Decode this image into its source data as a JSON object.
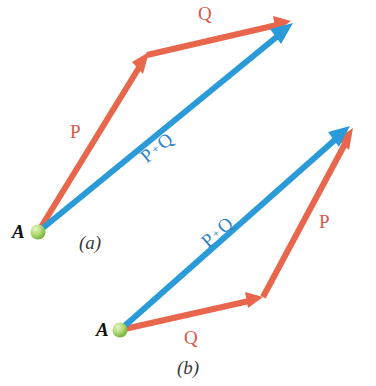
{
  "figure": {
    "background_color": "#ffffff",
    "colors": {
      "vector_p_q": "#e8674c",
      "vector_sum": "#2a9bd8",
      "label_red": "#d9594b",
      "label_blue": "#2f86c4",
      "point_marker": "#8cc63f",
      "text_dark": "#111111"
    }
  },
  "panels": [
    {
      "id": "a",
      "caption": "(a)",
      "origin_label": "A",
      "labels": {
        "p": "P",
        "q": "Q",
        "sum_first": "P",
        "sum_plus": "+",
        "sum_second": "Q"
      },
      "geometry": {
        "origin": [
          38,
          232
        ],
        "p_tip": [
          149,
          52
        ],
        "q_tip": [
          291,
          21
        ],
        "sum_tip": [
          293,
          23
        ]
      }
    },
    {
      "id": "b",
      "caption": "(b)",
      "origin_label": "A",
      "labels": {
        "p": "P",
        "q": "Q",
        "sum_first": "P",
        "sum_plus": "+",
        "sum_second": "Q"
      },
      "geometry": {
        "origin": [
          120,
          330
        ],
        "q_tip": [
          263,
          297
        ],
        "p_tip": [
          353,
          128
        ],
        "sum_tip": [
          350,
          126
        ]
      }
    }
  ],
  "text_positions": {
    "a_p": "P",
    "a_q": "Q",
    "a_A": "A",
    "a_caption": "(a)",
    "b_p": "P",
    "b_q": "Q",
    "b_A": "A",
    "b_caption": "(b)"
  }
}
